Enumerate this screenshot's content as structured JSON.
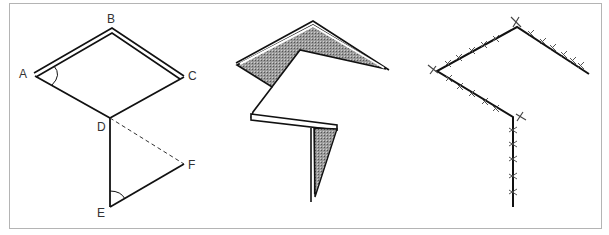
{
  "figure": {
    "panels": [
      {
        "id": "geometry",
        "labels": {
          "A": "A",
          "B": "B",
          "C": "C",
          "D": "D",
          "E": "E",
          "F": "F"
        }
      },
      {
        "id": "folded-paper"
      },
      {
        "id": "stitched-line"
      }
    ],
    "colors": {
      "frame": "#b4b4b4",
      "line": "#111111",
      "shade": "#8a8a8a",
      "label": "#333333"
    }
  }
}
